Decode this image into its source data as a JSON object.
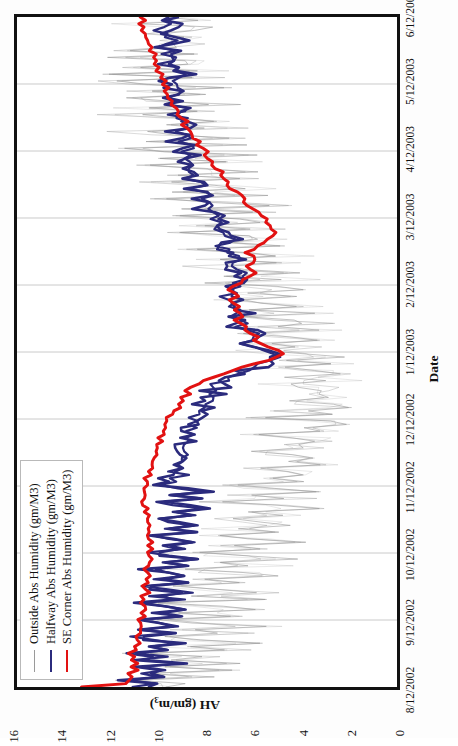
{
  "chart_data": {
    "type": "line",
    "title": "",
    "xlabel": "Date",
    "ylabel": "AH (gm/m3)",
    "ylabel_main": "AH (gm/m",
    "ylabel_sup": "3",
    "ylabel_tail": ")",
    "ylim": [
      0,
      16
    ],
    "yticks": [
      0,
      2,
      4,
      6,
      8,
      10,
      12,
      14,
      16
    ],
    "ytick_labels": [
      "0",
      "2",
      "4",
      "6",
      "8",
      "10",
      "12",
      "14",
      "16"
    ],
    "grid": "vertical-only",
    "legend_position": "top-left-inside",
    "xtick_labels": [
      "8/12/2002",
      "9/12/2002",
      "10/12/2002",
      "11/12/2002",
      "12/12/2002",
      "1/12/2003",
      "2/12/2003",
      "3/12/2003",
      "4/12/2003",
      "5/12/2003",
      "6/12/2003"
    ],
    "x_range_start": "8/12/2002",
    "x_range_end": "6/12/2003",
    "colors": {
      "outside": "#9a9a9a",
      "halfway": "#2b2b7d",
      "se_corner": "#e21212",
      "axis": "#111111",
      "gridline": "#c9c9c9",
      "background": "#ffffff"
    },
    "series": [
      {
        "name": "Outside Abs Humidity (gm/M3)",
        "key": "outside",
        "color": "#9a9a9a",
        "style": "thin noisy",
        "values": [
          10.4,
          9.1,
          11.6,
          8.2,
          10.9,
          7.4,
          9.8,
          6.9,
          10.2,
          8.0,
          11.1,
          7.2,
          9.4,
          6.4,
          8.8,
          10.5,
          7.0,
          9.2,
          6.1,
          8.4,
          10.0,
          6.8,
          9.0,
          5.9,
          7.8,
          9.6,
          6.3,
          8.5,
          5.5,
          7.6,
          9.3,
          6.0,
          8.1,
          5.2,
          7.2,
          8.9,
          5.7,
          7.7,
          4.9,
          6.8,
          8.5,
          5.4,
          7.3,
          4.6,
          6.4,
          8.1,
          5.1,
          6.9,
          4.3,
          6.0,
          7.7,
          4.8,
          6.5,
          4.0,
          5.6,
          7.3,
          4.5,
          6.1,
          3.7,
          5.2,
          6.9,
          4.2,
          5.7,
          3.4,
          4.8,
          6.5,
          3.9,
          5.3,
          3.1,
          4.4,
          6.1,
          3.6,
          4.9,
          2.8,
          4.0,
          5.7,
          3.3,
          4.5,
          2.5,
          3.6,
          5.3,
          3.0,
          4.1,
          2.2,
          3.2,
          4.9,
          2.7,
          3.7,
          2.4,
          3.4,
          5.1,
          2.9,
          4.3,
          2.6,
          3.9,
          5.5,
          3.2,
          4.7,
          3.0,
          4.2,
          5.9,
          3.5,
          5.1,
          3.3,
          4.6,
          6.3,
          3.8,
          5.5,
          3.6,
          5.0,
          6.7,
          4.1,
          5.9,
          3.9,
          5.4,
          7.1,
          4.4,
          6.3,
          4.2,
          5.8,
          7.5,
          4.7,
          6.7,
          4.5,
          6.2,
          7.9,
          5.0,
          7.1,
          4.8,
          6.6,
          8.3,
          5.3,
          7.5,
          5.1,
          7.0,
          8.7,
          5.6,
          7.9,
          5.4,
          7.4,
          9.1,
          5.9,
          8.3,
          5.7,
          7.8,
          9.5,
          6.2,
          8.7,
          6.0,
          8.2,
          9.9,
          6.5,
          9.1,
          6.3,
          8.6,
          10.3,
          6.8,
          9.5,
          6.6,
          9.0,
          10.7,
          7.1,
          9.9,
          6.9,
          9.4,
          11.1,
          7.4,
          10.3,
          7.2,
          9.8,
          11.5,
          7.7,
          10.7,
          7.5,
          10.2,
          11.9,
          8.0,
          11.1,
          7.8,
          10.6,
          12.3,
          8.3,
          11.5,
          8.1,
          11.0,
          9.6,
          8.6,
          11.9,
          8.4,
          11.4,
          9.0,
          8.9,
          10.2,
          8.7,
          9.8,
          9.3,
          8.5,
          10.6,
          9.1,
          9.5
        ]
      },
      {
        "name": "Halfway Abs Humidity (gm/M3)",
        "key": "halfway",
        "color": "#2b2b7d",
        "style": "thick oscillating",
        "values": [
          11.0,
          10.4,
          11.3,
          10.0,
          10.8,
          9.6,
          10.5,
          9.3,
          10.9,
          9.8,
          11.2,
          9.5,
          10.6,
          9.1,
          10.3,
          11.0,
          9.4,
          10.7,
          9.0,
          10.1,
          10.9,
          9.2,
          10.4,
          8.9,
          10.0,
          10.8,
          9.1,
          10.2,
          8.8,
          9.9,
          10.6,
          9.0,
          10.1,
          8.7,
          9.7,
          10.4,
          8.9,
          9.9,
          8.6,
          9.5,
          10.2,
          8.8,
          9.8,
          8.5,
          9.4,
          10.1,
          8.7,
          9.6,
          8.4,
          9.3,
          10.0,
          8.6,
          9.5,
          8.3,
          9.2,
          9.9,
          8.5,
          9.4,
          8.2,
          9.1,
          9.8,
          9.3,
          9.6,
          9.0,
          9.4,
          9.1,
          9.5,
          9.2,
          9.3,
          9.0,
          9.2,
          8.9,
          9.1,
          8.8,
          9.0,
          8.7,
          8.9,
          8.6,
          8.8,
          8.5,
          8.6,
          8.3,
          8.4,
          8.1,
          8.2,
          7.9,
          8.0,
          7.7,
          7.8,
          7.5,
          7.6,
          7.2,
          7.0,
          6.6,
          6.3,
          5.9,
          5.6,
          5.3,
          5.1,
          5.4,
          5.8,
          6.2,
          6.5,
          6.1,
          5.8,
          6.0,
          6.4,
          6.7,
          6.3,
          6.6,
          6.9,
          6.5,
          6.8,
          7.1,
          6.7,
          7.0,
          7.3,
          6.9,
          7.2,
          6.8,
          7.0,
          6.6,
          6.3,
          6.5,
          6.8,
          7.1,
          6.7,
          6.4,
          6.6,
          6.9,
          7.2,
          7.5,
          7.1,
          6.8,
          7.0,
          7.4,
          7.7,
          7.3,
          7.6,
          7.9,
          7.5,
          7.8,
          8.1,
          7.7,
          8.0,
          8.3,
          7.9,
          8.2,
          8.5,
          8.1,
          8.4,
          8.7,
          8.3,
          8.6,
          8.9,
          8.5,
          8.8,
          9.1,
          8.7,
          9.0,
          8.6,
          8.9,
          9.2,
          8.8,
          9.1,
          9.4,
          9.0,
          8.7,
          9.3,
          8.9,
          9.5,
          9.1,
          8.8,
          9.4,
          9.0,
          9.6,
          9.2,
          8.9,
          9.5,
          9.1,
          9.7,
          9.3,
          9.0,
          9.6,
          9.2,
          9.8,
          9.4,
          9.1,
          9.7,
          9.3,
          9.9,
          9.5,
          9.2,
          9.8,
          9.4,
          10.0,
          9.6,
          9.3,
          9.9,
          9.5
        ]
      },
      {
        "name": "SE Corner Abs Humidity (gm/M3)",
        "key": "se_corner",
        "color": "#e21212",
        "style": "thick smooth",
        "values": [
          13.2,
          11.4,
          11.2,
          11.1,
          11.3,
          11.0,
          11.2,
          10.9,
          11.1,
          11.0,
          11.2,
          10.9,
          11.0,
          10.8,
          11.0,
          10.9,
          10.8,
          10.9,
          10.7,
          10.8,
          10.9,
          10.7,
          10.8,
          10.6,
          10.7,
          10.8,
          10.6,
          10.7,
          10.5,
          10.6,
          10.7,
          10.5,
          10.6,
          10.4,
          10.5,
          10.6,
          10.4,
          10.5,
          10.3,
          10.4,
          10.5,
          10.3,
          10.4,
          10.3,
          10.4,
          10.5,
          10.4,
          10.5,
          10.4,
          10.5,
          10.6,
          10.5,
          10.6,
          10.5,
          10.6,
          10.7,
          10.6,
          10.7,
          10.6,
          10.7,
          10.6,
          10.5,
          10.6,
          10.4,
          10.5,
          10.3,
          10.4,
          10.2,
          10.3,
          10.1,
          10.2,
          10.0,
          10.1,
          9.9,
          10.0,
          9.8,
          9.9,
          9.7,
          9.8,
          9.6,
          9.7,
          9.4,
          9.5,
          9.2,
          9.3,
          9.0,
          9.1,
          8.8,
          8.9,
          8.6,
          8.4,
          8.1,
          7.8,
          7.4,
          7.0,
          6.5,
          6.0,
          5.5,
          5.1,
          4.8,
          5.0,
          5.4,
          5.8,
          6.1,
          5.9,
          6.2,
          6.5,
          6.3,
          6.6,
          6.8,
          6.5,
          6.7,
          6.9,
          6.6,
          6.8,
          7.0,
          6.7,
          6.9,
          7.1,
          6.8,
          6.6,
          6.4,
          6.2,
          6.0,
          6.2,
          6.4,
          6.1,
          5.9,
          6.1,
          6.3,
          6.0,
          5.8,
          5.6,
          5.4,
          5.2,
          5.0,
          5.2,
          5.4,
          5.6,
          5.5,
          5.7,
          5.9,
          6.1,
          6.3,
          6.5,
          6.4,
          6.6,
          6.8,
          7.0,
          7.2,
          7.1,
          7.3,
          7.5,
          7.4,
          7.6,
          7.8,
          7.7,
          7.9,
          8.1,
          8.0,
          8.2,
          8.4,
          8.3,
          8.5,
          8.7,
          8.6,
          8.8,
          9.0,
          8.9,
          9.1,
          9.3,
          9.2,
          9.4,
          9.6,
          9.5,
          9.7,
          9.6,
          9.8,
          9.7,
          9.9,
          9.8,
          10.0,
          9.9,
          10.1,
          10.0,
          10.2,
          10.1,
          10.3,
          10.2,
          10.4,
          10.3,
          10.5,
          10.4,
          10.6,
          10.5,
          10.7,
          10.6,
          10.8,
          10.7,
          10.9
        ]
      }
    ]
  },
  "legend": {
    "items": [
      {
        "label": "Outside Abs Humidity (gm/M3)",
        "swatch": "sw-gray"
      },
      {
        "label": "Halfway Abs Humidity (gm/M3)",
        "swatch": "sw-navy"
      },
      {
        "label": "SE Corner Abs Humidity (gm/M3)",
        "swatch": "sw-red"
      }
    ]
  }
}
